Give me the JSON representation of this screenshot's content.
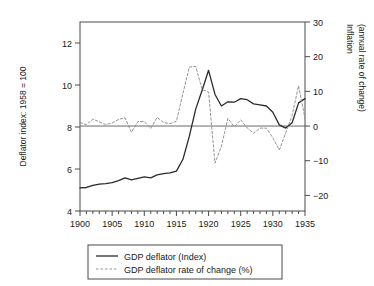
{
  "chart_data": {
    "type": "line",
    "title": "",
    "xlabel": "",
    "ylabel": "Deflator index: 1958 = 100",
    "y2label_line1": "Inflation",
    "y2label_line2": "(annual rate of change)",
    "xlim": [
      1900,
      1935
    ],
    "ylim": [
      4,
      13
    ],
    "y2lim": [
      -24.5,
      30
    ],
    "grid": false,
    "legend_position": "below",
    "xticks": [
      1900,
      1905,
      1910,
      1915,
      1920,
      1925,
      1930,
      1935
    ],
    "xtick_labels": [
      "1900",
      "1905",
      "1910",
      "1915",
      "1920",
      "1925",
      "1930",
      "1935"
    ],
    "xminor_step": 1,
    "yticks": [
      4,
      6,
      8,
      10,
      12
    ],
    "ytick_labels": [
      "4",
      "6",
      "8",
      "10",
      "12"
    ],
    "y2ticks": [
      -20,
      -10,
      0,
      10,
      20,
      30
    ],
    "y2tick_labels": [
      "−20",
      "−10",
      "0",
      "10",
      "20",
      "30"
    ],
    "zero_line_value": 0,
    "x": [
      1900,
      1901,
      1902,
      1903,
      1904,
      1905,
      1906,
      1907,
      1908,
      1909,
      1910,
      1911,
      1912,
      1913,
      1914,
      1915,
      1916,
      1917,
      1918,
      1919,
      1920,
      1921,
      1922,
      1923,
      1924,
      1925,
      1926,
      1927,
      1928,
      1929,
      1930,
      1931,
      1932,
      1933,
      1934,
      1935
    ],
    "series": [
      {
        "name": "GDP deflator (Index)",
        "axis": "left",
        "style": "solid",
        "color": "#2b2b2b",
        "values": [
          5.1,
          5.12,
          5.22,
          5.28,
          5.3,
          5.35,
          5.45,
          5.58,
          5.48,
          5.55,
          5.62,
          5.58,
          5.72,
          5.78,
          5.82,
          5.9,
          6.45,
          7.55,
          8.85,
          9.75,
          10.7,
          9.55,
          9.0,
          9.2,
          9.18,
          9.35,
          9.3,
          9.1,
          9.05,
          9.0,
          8.7,
          8.1,
          7.95,
          8.2,
          9.15,
          9.35
        ]
      },
      {
        "name": "GDP deflator rate of change (%)",
        "axis": "right",
        "style": "dashed",
        "color": "#8a8a8a",
        "values": [
          1.0,
          0.4,
          2.0,
          1.2,
          0.4,
          0.9,
          1.9,
          2.4,
          -1.8,
          1.3,
          1.3,
          -0.7,
          2.5,
          1.0,
          0.7,
          1.4,
          9.3,
          17.0,
          17.2,
          10.5,
          9.8,
          -10.7,
          -5.8,
          2.2,
          -0.2,
          1.8,
          -0.5,
          -2.1,
          -0.6,
          -0.6,
          -3.4,
          -6.9,
          -2.0,
          3.1,
          11.6,
          2.2
        ]
      }
    ]
  },
  "legend": {
    "items": [
      {
        "label": "GDP deflator (Index)",
        "style": "solid"
      },
      {
        "label": "GDP deflator rate of change (%)",
        "style": "dashed"
      }
    ]
  }
}
